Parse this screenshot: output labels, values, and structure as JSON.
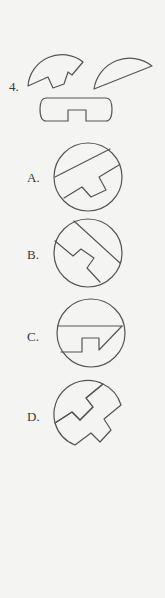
{
  "question": {
    "number_label": "4.",
    "pieces": [
      "mushroom-arc-piece",
      "circular-segment-piece",
      "notched-capsule-piece"
    ]
  },
  "options": [
    {
      "label": "A."
    },
    {
      "label": "B."
    },
    {
      "label": "C."
    },
    {
      "label": "D."
    }
  ],
  "colors": {
    "background": "#f4f4f2",
    "stroke": "#555555",
    "text": "#3a3a3a"
  }
}
